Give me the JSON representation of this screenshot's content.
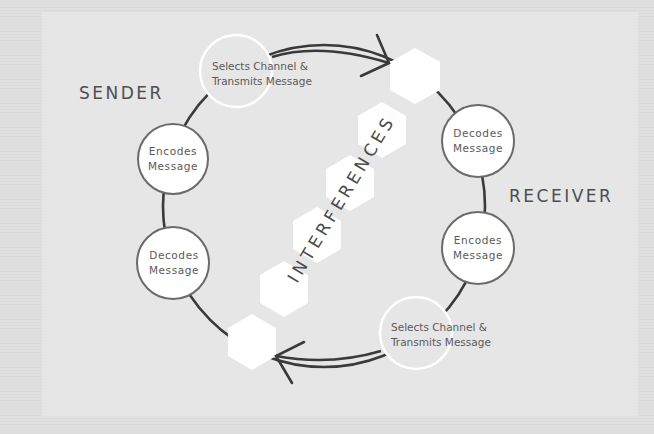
{
  "diagram": {
    "sender_label": "SENDER",
    "receiver_label": "RECEIVER",
    "interferences_label": "INTERFERENCES",
    "sender": {
      "encodes": {
        "line1": "Encodes",
        "line2": "Message"
      },
      "decodes": {
        "line1": "Decodes",
        "line2": "Message"
      }
    },
    "receiver": {
      "decodes": {
        "line1": "Decodes",
        "line2": "Message"
      },
      "encodes": {
        "line1": "Encodes",
        "line2": "Message"
      }
    },
    "channel_top": {
      "line1": "Selects Channel &",
      "line2": "Transmits Message"
    },
    "channel_bottom": {
      "line1": "Selects Channel &",
      "line2": "Transmits Message"
    },
    "hexagon_count": 6,
    "colors": {
      "ring": "#3a3a3a",
      "node_fill": "#ffffff",
      "node_stroke": "#6a6a6a",
      "panel_bg": "#e6e6e6",
      "text": "#5a5a5a"
    }
  }
}
